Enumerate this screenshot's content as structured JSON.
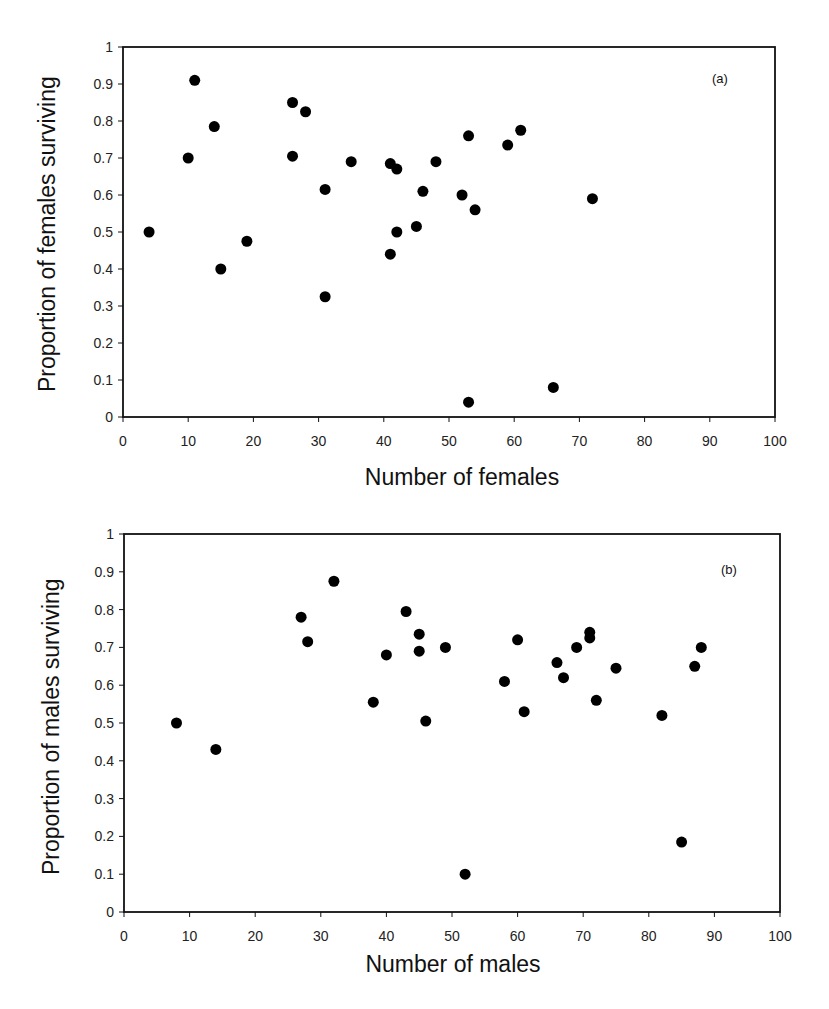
{
  "chart_data": [
    {
      "type": "scatter",
      "panel_label": "(a)",
      "title": "",
      "xlabel": "Number of females",
      "ylabel": "Proportion of females surviving",
      "xlim": [
        0,
        100
      ],
      "ylim": [
        0,
        1
      ],
      "x_ticks": [
        "0",
        "10",
        "20",
        "30",
        "40",
        "50",
        "60",
        "70",
        "80",
        "90",
        "100"
      ],
      "y_ticks": [
        "0",
        "0.1",
        "0.2",
        "0.3",
        "0.4",
        "0.5",
        "0.6",
        "0.7",
        "0.8",
        "0.9",
        "1"
      ],
      "grid": false,
      "legend": null,
      "series": [
        {
          "name": "females",
          "marker": "filled-circle",
          "color": "#000000",
          "points": [
            {
              "x": 4,
              "y": 0.5
            },
            {
              "x": 10,
              "y": 0.7
            },
            {
              "x": 11,
              "y": 0.91
            },
            {
              "x": 14,
              "y": 0.785
            },
            {
              "x": 15,
              "y": 0.4
            },
            {
              "x": 19,
              "y": 0.475
            },
            {
              "x": 26,
              "y": 0.85
            },
            {
              "x": 26,
              "y": 0.705
            },
            {
              "x": 28,
              "y": 0.825
            },
            {
              "x": 31,
              "y": 0.615
            },
            {
              "x": 31,
              "y": 0.325
            },
            {
              "x": 35,
              "y": 0.69
            },
            {
              "x": 41,
              "y": 0.685
            },
            {
              "x": 42,
              "y": 0.67
            },
            {
              "x": 41,
              "y": 0.44
            },
            {
              "x": 42,
              "y": 0.5
            },
            {
              "x": 45,
              "y": 0.515
            },
            {
              "x": 46,
              "y": 0.61
            },
            {
              "x": 48,
              "y": 0.69
            },
            {
              "x": 52,
              "y": 0.6
            },
            {
              "x": 53,
              "y": 0.76
            },
            {
              "x": 54,
              "y": 0.56
            },
            {
              "x": 53,
              "y": 0.04
            },
            {
              "x": 59,
              "y": 0.735
            },
            {
              "x": 61,
              "y": 0.775
            },
            {
              "x": 66,
              "y": 0.08
            },
            {
              "x": 72,
              "y": 0.59
            }
          ]
        }
      ]
    },
    {
      "type": "scatter",
      "panel_label": "(b)",
      "title": "",
      "xlabel": "Number of males",
      "ylabel": "Proportion of males surviving",
      "xlim": [
        0,
        100
      ],
      "ylim": [
        0,
        1
      ],
      "x_ticks": [
        "0",
        "10",
        "20",
        "30",
        "40",
        "50",
        "60",
        "70",
        "80",
        "90",
        "100"
      ],
      "y_ticks": [
        "0",
        "0.1",
        "0.2",
        "0.3",
        "0.4",
        "0.5",
        "0.6",
        "0.7",
        "0.8",
        "0.9",
        "1"
      ],
      "grid": false,
      "legend": null,
      "series": [
        {
          "name": "males",
          "marker": "filled-circle",
          "color": "#000000",
          "points": [
            {
              "x": 8,
              "y": 0.5
            },
            {
              "x": 14,
              "y": 0.43
            },
            {
              "x": 27,
              "y": 0.78
            },
            {
              "x": 28,
              "y": 0.715
            },
            {
              "x": 32,
              "y": 0.875
            },
            {
              "x": 38,
              "y": 0.555
            },
            {
              "x": 40,
              "y": 0.68
            },
            {
              "x": 43,
              "y": 0.795
            },
            {
              "x": 45,
              "y": 0.735
            },
            {
              "x": 45,
              "y": 0.69
            },
            {
              "x": 46,
              "y": 0.505
            },
            {
              "x": 49,
              "y": 0.7
            },
            {
              "x": 52,
              "y": 0.1
            },
            {
              "x": 58,
              "y": 0.61
            },
            {
              "x": 60,
              "y": 0.72
            },
            {
              "x": 61,
              "y": 0.53
            },
            {
              "x": 66,
              "y": 0.66
            },
            {
              "x": 67,
              "y": 0.62
            },
            {
              "x": 69,
              "y": 0.7
            },
            {
              "x": 71,
              "y": 0.74
            },
            {
              "x": 71,
              "y": 0.725
            },
            {
              "x": 72,
              "y": 0.56
            },
            {
              "x": 75,
              "y": 0.645
            },
            {
              "x": 82,
              "y": 0.52
            },
            {
              "x": 85,
              "y": 0.185
            },
            {
              "x": 87,
              "y": 0.65
            },
            {
              "x": 88,
              "y": 0.7
            }
          ]
        }
      ]
    }
  ]
}
